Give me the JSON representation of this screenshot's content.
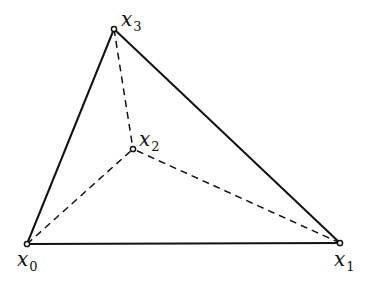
{
  "diagram": {
    "type": "tetrahedron-projection",
    "colors": {
      "stroke": "#111111",
      "background": "#ffffff"
    },
    "vertices": [
      {
        "id": "x0",
        "base": "x",
        "sub": "0",
        "x": 27,
        "y": 244,
        "label_x": 17,
        "label_y": 266
      },
      {
        "id": "x1",
        "base": "x",
        "sub": "1",
        "x": 340,
        "y": 243,
        "label_x": 334,
        "label_y": 266
      },
      {
        "id": "x2",
        "base": "x",
        "sub": "2",
        "x": 133,
        "y": 149,
        "label_x": 139,
        "label_y": 146
      },
      {
        "id": "x3",
        "base": "x",
        "sub": "3",
        "x": 114,
        "y": 29,
        "label_x": 121,
        "label_y": 26
      }
    ],
    "edges": [
      {
        "from": "x0",
        "to": "x1",
        "style": "solid"
      },
      {
        "from": "x0",
        "to": "x3",
        "style": "solid"
      },
      {
        "from": "x1",
        "to": "x3",
        "style": "solid"
      },
      {
        "from": "x0",
        "to": "x2",
        "style": "dashed"
      },
      {
        "from": "x1",
        "to": "x2",
        "style": "dashed"
      },
      {
        "from": "x3",
        "to": "x2",
        "style": "dashed"
      }
    ]
  }
}
